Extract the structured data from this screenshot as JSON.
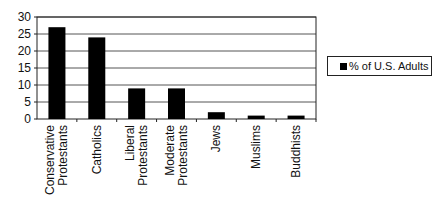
{
  "chart_data": {
    "type": "bar",
    "title": "",
    "xlabel": "",
    "ylabel": "",
    "categories": [
      "Conservative Protestants",
      "Catholics",
      "Liberal Protestants",
      "Moderate Protestants",
      "Jews",
      "Muslims",
      "Buddhists"
    ],
    "category_lines": [
      [
        "Conservative",
        "Protestants"
      ],
      [
        "Catholics"
      ],
      [
        "Liberal",
        "Protestants"
      ],
      [
        "Moderate",
        "Protestants"
      ],
      [
        "Jews"
      ],
      [
        "Muslims"
      ],
      [
        "Buddhists"
      ]
    ],
    "series": [
      {
        "name": "% of U.S. Adults",
        "values": [
          27,
          24,
          9,
          9,
          2,
          1,
          1
        ],
        "color": "#000000"
      }
    ],
    "ylim": [
      0,
      30
    ],
    "yticks": [
      0,
      5,
      10,
      15,
      20,
      25,
      30
    ],
    "grid": true,
    "legend_position": "right",
    "tick_label_rotation": -90
  },
  "legend": {
    "label": "% of U.S. Adults"
  }
}
